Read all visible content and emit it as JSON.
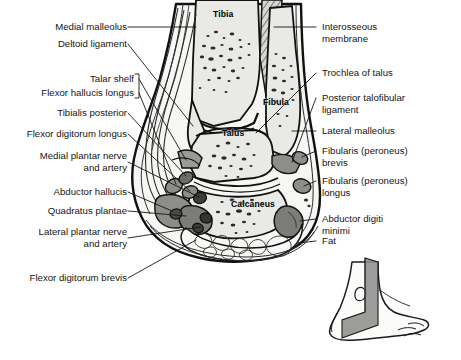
{
  "figure": {
    "ink_color": "#141414",
    "bone_fill": "#e9e9e5",
    "soft_tissue_fill": "#f4f4f1",
    "muscle_fill": "#8d8d8a",
    "dark_muscle_fill": "#4a4a48",
    "plane_fill": "#8e8e8c"
  },
  "labels_left": [
    {
      "id": "medial-malleolus",
      "text": "Medial malleolus"
    },
    {
      "id": "deltoid-ligament",
      "text": "Deltoid ligament"
    },
    {
      "id": "talar-shelf",
      "text": "Talar shelf"
    },
    {
      "id": "flexor-hallucis-longus",
      "text": "Flexor hallucis longus"
    },
    {
      "id": "tibialis-posterior",
      "text": "Tibialis posterior"
    },
    {
      "id": "flexor-digitorum-longus",
      "text": "Flexor digitorum longus"
    },
    {
      "id": "medial-plantar-nerve-and-artery",
      "text": "Medial plantar nerve\nand artery"
    },
    {
      "id": "abductor-hallucis",
      "text": "Abductor hallucis"
    },
    {
      "id": "quadratus-plantae",
      "text": "Quadratus plantae"
    },
    {
      "id": "lateral-plantar-nerve-and-artery",
      "text": "Lateral plantar nerve\nand artery"
    },
    {
      "id": "flexor-digitorum-brevis",
      "text": "Flexor digitorum brevis"
    }
  ],
  "labels_right": [
    {
      "id": "interosseous-membrane",
      "text": "Interosseous\nmembrane"
    },
    {
      "id": "trochlea-of-talus",
      "text": "Trochlea of talus"
    },
    {
      "id": "posterior-talofibular-ligament",
      "text": "Posterior talofibular\nligament"
    },
    {
      "id": "lateral-malleolus",
      "text": "Lateral malleolus"
    },
    {
      "id": "fibularis-peroneus-brevis",
      "text": "Fibularis (peroneus)\nbrevis"
    },
    {
      "id": "fibularis-peroneus-longus",
      "text": "Fibularis (peroneus)\nlongus"
    },
    {
      "id": "abductor-digiti-minimi",
      "text": "Abductor digiti\nminimi"
    },
    {
      "id": "fat",
      "text": "Fat"
    }
  ],
  "bone_labels": [
    {
      "id": "tibia",
      "text": "Tibia"
    },
    {
      "id": "fibula",
      "text": "Fibula"
    },
    {
      "id": "talus",
      "text": "Talus"
    },
    {
      "id": "calcaneus",
      "text": "Calcaneus"
    }
  ],
  "inset": {
    "id": "orientation-inset",
    "description": "Lateral view of foot with coronal section plane"
  }
}
